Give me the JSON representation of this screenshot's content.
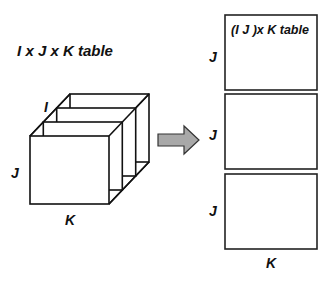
{
  "diagram": {
    "left": {
      "title": "I x J x K table",
      "axis_i": "I",
      "axis_j": "J",
      "axis_k": "K",
      "slice_count": 4
    },
    "arrow": {
      "fill": "#a8a8a8",
      "stroke": "#333333"
    },
    "right": {
      "title": "(I J )x K table",
      "blocks": [
        {
          "row_label": "J"
        },
        {
          "row_label": "J"
        },
        {
          "row_label": "J"
        }
      ],
      "col_label": "K"
    }
  }
}
